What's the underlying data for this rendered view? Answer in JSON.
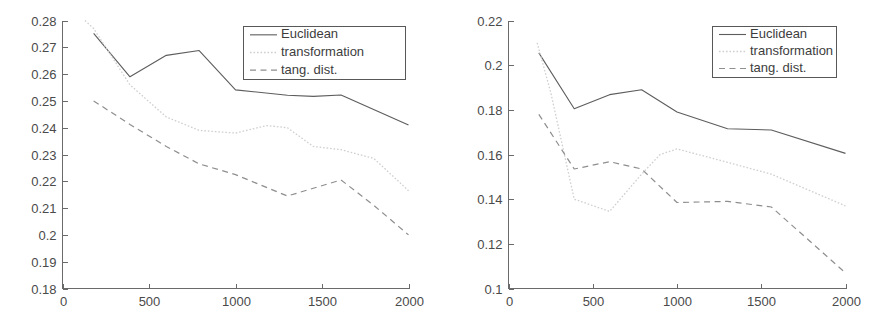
{
  "figure": {
    "panel_count": 2,
    "background_color": "#ffffff",
    "line_colors": {
      "euclidean": "#5d5d5d",
      "transformation": "#cfcfcf",
      "tang_dist": "#8e8e8e"
    }
  },
  "chart_data": [
    {
      "panel": "left",
      "type": "line",
      "title": "",
      "subtitle": "",
      "xlabel": "",
      "ylabel": "",
      "xlim": [
        0,
        2000
      ],
      "ylim": [
        0.18,
        0.28
      ],
      "xticks": [
        0,
        500,
        1000,
        1500,
        2000
      ],
      "xticklabels": [
        "0",
        "500",
        "1000",
        "1500",
        "2000"
      ],
      "yticks": [
        0.18,
        0.19,
        0.2,
        0.21,
        0.22,
        0.23,
        0.24,
        0.25,
        0.26,
        0.27,
        0.28
      ],
      "yticklabels": [
        "0.18",
        "0.19",
        "0.2",
        "0.21",
        "0.22",
        "0.23",
        "0.24",
        "0.25",
        "0.26",
        "0.27",
        "0.28"
      ],
      "grid": false,
      "legend_position": "upper-right",
      "legend_entries": [
        "Euclidean",
        "transformation",
        "tang. dist."
      ],
      "series": [
        {
          "name": "Euclidean",
          "style": "solid",
          "color": "#5d5d5d",
          "x": [
            180,
            390,
            600,
            790,
            1000,
            1300,
            1450,
            1610,
            2000
          ],
          "values": [
            0.2752,
            0.259,
            0.267,
            0.2688,
            0.2541,
            0.2521,
            0.2517,
            0.2522,
            0.241
          ]
        },
        {
          "name": "transformation",
          "style": "dotted",
          "color": "#cfcfcf",
          "x": [
            130,
            180,
            390,
            600,
            790,
            1000,
            1180,
            1300,
            1450,
            1610,
            1800,
            2000
          ],
          "values": [
            0.28,
            0.277,
            0.256,
            0.244,
            0.239,
            0.238,
            0.2408,
            0.24,
            0.233,
            0.2318,
            0.2285,
            0.2165
          ]
        },
        {
          "name": "tang. dist.",
          "style": "dashed",
          "color": "#8e8e8e",
          "x": [
            180,
            390,
            600,
            790,
            1000,
            1300,
            1610,
            1800,
            2000
          ],
          "values": [
            0.25,
            0.2412,
            0.233,
            0.2265,
            0.2225,
            0.2145,
            0.2205,
            0.211,
            0.2
          ]
        }
      ]
    },
    {
      "panel": "right",
      "type": "line",
      "title": "",
      "subtitle": "",
      "xlabel": "",
      "ylabel": "",
      "xlim": [
        0,
        2000
      ],
      "ylim": [
        0.1,
        0.22
      ],
      "xticks": [
        0,
        500,
        1000,
        1500,
        2000
      ],
      "xticklabels": [
        "0",
        "500",
        "1000",
        "1500",
        "2000"
      ],
      "yticks": [
        0.1,
        0.12,
        0.14,
        0.16,
        0.18,
        0.2,
        0.22
      ],
      "yticklabels": [
        "0.1",
        "0.12",
        "0.14",
        "0.16",
        "0.18",
        "0.2",
        "0.22"
      ],
      "grid": false,
      "legend_position": "upper-right",
      "legend_entries": [
        "Euclidean",
        "transformation",
        "tang. dist."
      ],
      "series": [
        {
          "name": "Euclidean",
          "style": "solid",
          "color": "#5d5d5d",
          "x": [
            180,
            390,
            600,
            790,
            1000,
            1300,
            1560,
            2000
          ],
          "values": [
            0.2055,
            0.1805,
            0.1868,
            0.189,
            0.179,
            0.1715,
            0.171,
            0.1605
          ]
        },
        {
          "name": "transformation",
          "style": "dotted",
          "color": "#cfcfcf",
          "x": [
            170,
            250,
            390,
            600,
            790,
            900,
            1000,
            1300,
            1560,
            2000
          ],
          "values": [
            0.21,
            0.188,
            0.14,
            0.1345,
            0.1512,
            0.16,
            0.1625,
            0.1565,
            0.1512,
            0.137
          ]
        },
        {
          "name": "tang. dist.",
          "style": "dashed",
          "color": "#8e8e8e",
          "x": [
            180,
            390,
            600,
            790,
            1000,
            1300,
            1560,
            2000
          ],
          "values": [
            0.178,
            0.1535,
            0.1568,
            0.1535,
            0.1385,
            0.139,
            0.1365,
            0.107
          ]
        }
      ]
    }
  ]
}
